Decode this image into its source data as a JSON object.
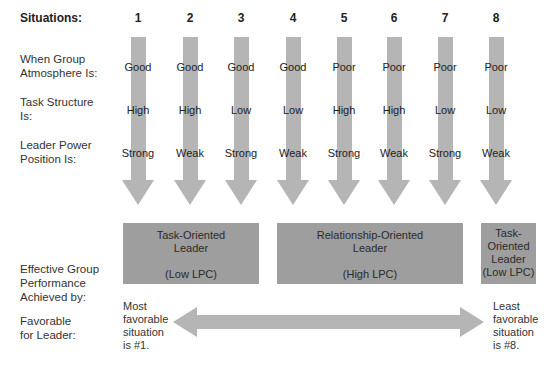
{
  "header": {
    "label": "Situations:"
  },
  "situations": [
    {
      "num": "1",
      "atmosphere": "Good",
      "task": "High",
      "power": "Strong",
      "x": 138
    },
    {
      "num": "2",
      "atmosphere": "Good",
      "task": "High",
      "power": "Weak",
      "x": 190
    },
    {
      "num": "3",
      "atmosphere": "Good",
      "task": "Low",
      "power": "Strong",
      "x": 241
    },
    {
      "num": "4",
      "atmosphere": "Good",
      "task": "Low",
      "power": "Weak",
      "x": 293
    },
    {
      "num": "5",
      "atmosphere": "Poor",
      "task": "High",
      "power": "Strong",
      "x": 344
    },
    {
      "num": "6",
      "atmosphere": "Poor",
      "task": "High",
      "power": "Weak",
      "x": 394
    },
    {
      "num": "7",
      "atmosphere": "Poor",
      "task": "Low",
      "power": "Strong",
      "x": 445
    },
    {
      "num": "8",
      "atmosphere": "Poor",
      "task": "Low",
      "power": "Weak",
      "x": 496
    }
  ],
  "rows": {
    "atmosphere": {
      "line1": "When Group",
      "line2": "Atmosphere Is:"
    },
    "task": {
      "line1": "Task Structure",
      "line2": "Is:"
    },
    "power": {
      "line1": "Leader Power",
      "line2": "Position Is:"
    },
    "performance": {
      "line1": "Effective Group",
      "line2": "Performance",
      "line3": "Achieved by:"
    },
    "favorable": {
      "line1": "Favorable",
      "line2": "for Leader:"
    }
  },
  "boxes": [
    {
      "line1": "Task-Oriented",
      "line2": "Leader",
      "line3": "(Low LPC)"
    },
    {
      "line1": "Relationship-Oriented",
      "line2": "Leader",
      "line3": "(High LPC)"
    },
    {
      "line1": "Task-",
      "line2": "Oriented",
      "line3": "Leader",
      "line4": "(Low LPC)"
    }
  ],
  "favorability": {
    "most": {
      "line1": "Most",
      "line2": "favorable",
      "line3": "situation",
      "line4": "is #1."
    },
    "least": {
      "line1": "Least",
      "line2": "favorable",
      "line3": "situation",
      "line4": "is #8."
    }
  },
  "colors": {
    "arrow": "#b4b4b4",
    "box": "#9e9e9e"
  }
}
